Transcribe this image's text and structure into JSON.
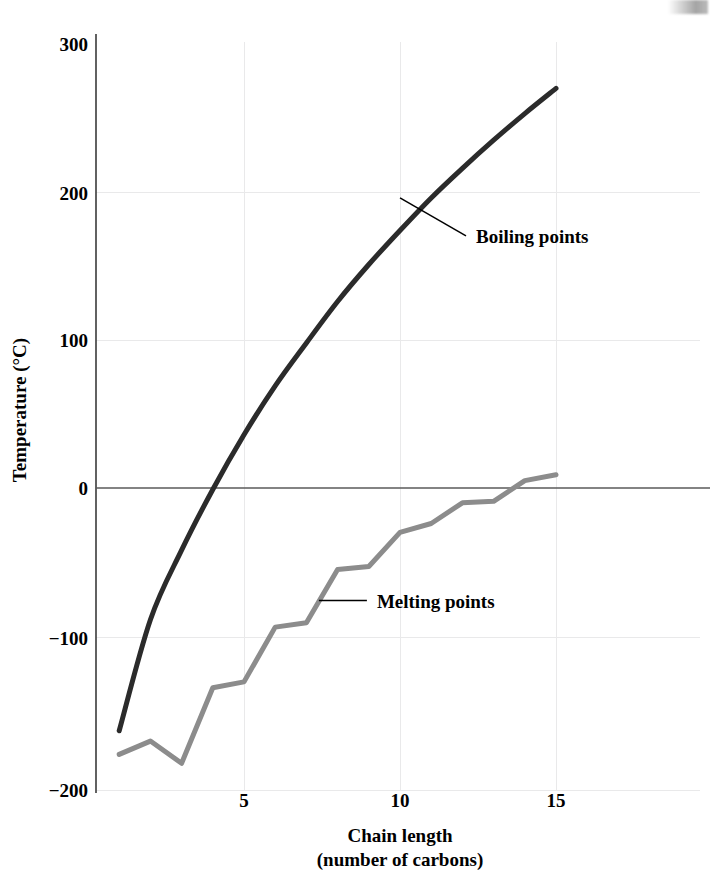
{
  "chart_data": {
    "type": "line",
    "title": "",
    "xlabel": "Chain length",
    "xlabel_sub": "(number of carbons)",
    "ylabel": "Temperature (°C)",
    "xlim": [
      0.2,
      17.2
    ],
    "ylim": [
      -200,
      300
    ],
    "xticks": [
      5,
      10,
      15
    ],
    "xtick_labels": [
      "5",
      "10",
      "15"
    ],
    "yticks": [
      -200,
      -100,
      0,
      100,
      200,
      300
    ],
    "ytick_labels": [
      "−200",
      "−100",
      "0",
      "100",
      "200",
      "300"
    ],
    "grid": "faint",
    "legend_position": "inline-annotations",
    "x": [
      1,
      2,
      3,
      4,
      5,
      6,
      7,
      8,
      9,
      10,
      11,
      12,
      13,
      14,
      15
    ],
    "series": [
      {
        "name": "Boiling points",
        "color": "#2b2b2b",
        "style": "smooth-curve",
        "values": [
          -164,
          -89,
          -42,
          -1,
          36,
          69,
          98,
          126,
          151,
          174,
          196,
          216,
          235,
          253,
          270
        ]
      },
      {
        "name": "Melting points",
        "color": "#8c8c8c",
        "style": "polyline",
        "values": [
          -180,
          -171,
          -186,
          -135,
          -131,
          -94,
          -91,
          -55,
          -53,
          -30,
          -24,
          -10,
          -9,
          5,
          9
        ]
      }
    ],
    "annotations": [
      {
        "text": "Boiling points",
        "series": "Boiling points",
        "anchor_x": 10.0,
        "anchor_y": 196
      },
      {
        "text": "Melting points",
        "series": "Melting points",
        "anchor_x": 7.4,
        "anchor_y": -76
      }
    ]
  },
  "axes": {
    "y_axis_title": "Temperature (°C)",
    "x_axis_title_line1": "Chain length",
    "x_axis_title_line2": "(number of carbons)"
  }
}
